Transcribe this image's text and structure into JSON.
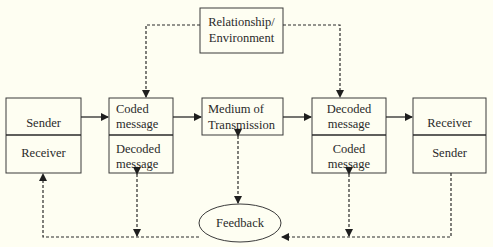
{
  "diagram": {
    "title": "",
    "nodes": {
      "relationship": {
        "lines": [
          "Relationship/",
          "Environment"
        ]
      },
      "left_party": {
        "top": "Sender",
        "bottom": "Receiver"
      },
      "left_message": {
        "top": [
          "Coded",
          "message"
        ],
        "bottom": [
          "Decoded",
          "message"
        ]
      },
      "medium": {
        "lines": [
          "Medium of",
          "Transmission"
        ]
      },
      "right_message": {
        "top": [
          "Decoded",
          "message"
        ],
        "bottom": [
          "Coded",
          "message"
        ]
      },
      "right_party": {
        "top": "Receiver",
        "bottom": "Sender"
      },
      "feedback": {
        "label": "Feedback"
      }
    },
    "edges": [
      {
        "from": "left_party",
        "to": "left_message",
        "style": "solid"
      },
      {
        "from": "left_message",
        "to": "medium",
        "style": "solid"
      },
      {
        "from": "medium",
        "to": "right_message",
        "style": "solid"
      },
      {
        "from": "right_message",
        "to": "right_party",
        "style": "solid"
      },
      {
        "from": "relationship",
        "to": "left_message",
        "style": "dashed"
      },
      {
        "from": "relationship",
        "to": "right_message",
        "style": "dashed"
      },
      {
        "from": "feedback",
        "to": "medium",
        "style": "dashed"
      },
      {
        "from": "right_party",
        "to": "feedback",
        "style": "dashed"
      },
      {
        "from": "feedback",
        "to": "left_party",
        "style": "dashed"
      },
      {
        "from": "bottom_line",
        "to": "left_message",
        "style": "dashed",
        "bidirectional": true
      },
      {
        "from": "bottom_line",
        "to": "right_message",
        "style": "dashed",
        "bidirectional": true
      }
    ]
  }
}
